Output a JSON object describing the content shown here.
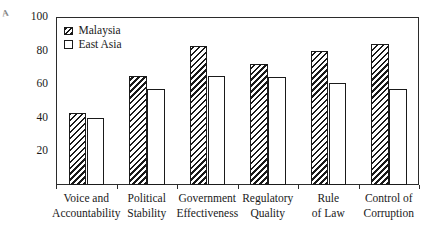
{
  "figure": {
    "corner_mark": "A"
  },
  "legend": {
    "position": "top-left-inside",
    "entries": [
      {
        "label": "Malaysia",
        "swatch": "hatched-diagonal"
      },
      {
        "label": "East Asia",
        "swatch": "white-outline"
      }
    ]
  },
  "axes": {
    "y_ticks": [
      "100",
      "80",
      "60",
      "40",
      "20"
    ],
    "y_tick_values": [
      100,
      80,
      60,
      40,
      20
    ],
    "ylim": [
      0,
      100
    ],
    "grid": "off"
  },
  "chart_data": {
    "type": "bar",
    "title": "",
    "subtitle": "",
    "xlabel": "",
    "ylabel": "",
    "ylim": [
      0,
      100
    ],
    "grid": false,
    "legend_position": "top-left",
    "categories": [
      "Voice and Accountability",
      "Political Stability",
      "Government Effectiveness",
      "Regulatory Quality",
      "Rule of Law",
      "Control of Corruption"
    ],
    "category_lines": [
      [
        "Voice and",
        "Accountability"
      ],
      [
        "Political",
        "Stability"
      ],
      [
        "Government",
        "Effectiveness"
      ],
      [
        "Regulatory",
        "Quality"
      ],
      [
        "Rule",
        "of Law"
      ],
      [
        "Control of",
        "Corruption"
      ]
    ],
    "series": [
      {
        "name": "Malaysia",
        "values": [
          43,
          65,
          83,
          72,
          80,
          84
        ]
      },
      {
        "name": "East Asia",
        "values": [
          40,
          57,
          65,
          64,
          61,
          57
        ]
      }
    ],
    "tick_labels_y": [
      20,
      40,
      60,
      80,
      100
    ]
  }
}
